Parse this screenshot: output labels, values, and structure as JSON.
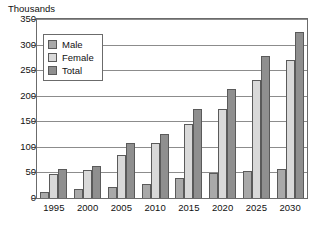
{
  "chart_data": {
    "type": "bar",
    "title": "",
    "subtitle": "",
    "ylabel": "Thousands",
    "xlabel": "",
    "ylim": [
      0,
      350
    ],
    "yticks": [
      0,
      50,
      100,
      150,
      200,
      250,
      300,
      350
    ],
    "ytick_labels": [
      "0",
      "50",
      "100",
      "150",
      "200",
      "250",
      "300",
      "350"
    ],
    "grid": true,
    "legend_position": "top-left-inside",
    "categories": [
      "1995",
      "2000",
      "2005",
      "2010",
      "2015",
      "2020",
      "2025",
      "2030"
    ],
    "series": [
      {
        "name": "Male",
        "color": "#a9a9a9",
        "values": [
          12,
          17,
          22,
          28,
          40,
          48,
          52,
          57
        ]
      },
      {
        "name": "Female",
        "color": "#d9d9d9",
        "values": [
          46,
          54,
          85,
          107,
          145,
          175,
          230,
          270
        ]
      },
      {
        "name": "Total",
        "color": "#8f8f8f",
        "values": [
          57,
          62,
          107,
          125,
          175,
          213,
          278,
          325
        ]
      }
    ]
  },
  "legend": {
    "items": [
      {
        "label": "Male"
      },
      {
        "label": "Female"
      },
      {
        "label": "Total"
      }
    ]
  },
  "colors": {
    "male": "#a9a9a9",
    "female": "#d9d9d9",
    "total": "#8f8f8f",
    "frame": "#6b6b6b",
    "gridline": "#8c8c8c",
    "text": "#111111",
    "background": "#ffffff"
  }
}
